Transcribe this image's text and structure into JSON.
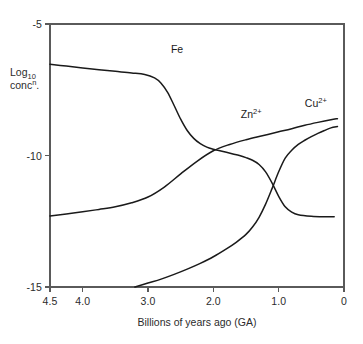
{
  "chart_data": {
    "type": "line",
    "title": "",
    "xlabel": "Billions of years ago (GA)",
    "ylabel_line1": "Log",
    "ylabel_sub": "10",
    "ylabel_line2": "conc",
    "ylabel_sup": "n",
    "ylabel_tail": ".",
    "xlim": [
      4.5,
      0
    ],
    "ylim": [
      -15,
      -5
    ],
    "x_reversed": true,
    "grid": false,
    "legend": "inline curve labels",
    "xticks": [
      {
        "value": 4.5,
        "label": "4.5"
      },
      {
        "value": 4.0,
        "label": "4.0"
      },
      {
        "value": 3.0,
        "label": "3.0"
      },
      {
        "value": 2.0,
        "label": "2.0"
      },
      {
        "value": 1.0,
        "label": "1.0"
      },
      {
        "value": 0.0,
        "label": "0"
      }
    ],
    "yticks": [
      {
        "value": -5,
        "label": "-5"
      },
      {
        "value": -10,
        "label": "-10"
      },
      {
        "value": -15,
        "label": "-15"
      }
    ],
    "series": [
      {
        "name": "Fe",
        "label_html": "Fe",
        "label_x": 2.65,
        "label_y": -6.0,
        "color": "#1a1a1a",
        "x": [
          4.5,
          4.25,
          4.0,
          3.75,
          3.5,
          3.25,
          3.05,
          2.9,
          2.8,
          2.7,
          2.6,
          2.5,
          2.4,
          2.3,
          2.2,
          2.1,
          2.0,
          1.9,
          1.8,
          1.7,
          1.6,
          1.5,
          1.4,
          1.3,
          1.2,
          1.1,
          1.0,
          0.9,
          0.8,
          0.7,
          0.5,
          0.3,
          0.15
        ],
        "y": [
          -6.53,
          -6.6,
          -6.67,
          -6.74,
          -6.8,
          -6.86,
          -6.92,
          -7.05,
          -7.25,
          -7.6,
          -8.1,
          -8.62,
          -9.05,
          -9.35,
          -9.55,
          -9.68,
          -9.76,
          -9.82,
          -9.88,
          -9.94,
          -10.0,
          -10.08,
          -10.18,
          -10.34,
          -10.62,
          -11.05,
          -11.55,
          -11.95,
          -12.15,
          -12.25,
          -12.31,
          -12.33,
          -12.33
        ]
      },
      {
        "name": "Zn2+",
        "label_html": "Zn<sup>2+</sup>",
        "label_x": 1.58,
        "label_y": -8.45,
        "color": "#1a1a1a",
        "x": [
          4.5,
          4.25,
          4.0,
          3.75,
          3.5,
          3.25,
          3.0,
          2.75,
          2.5,
          2.25,
          2.0,
          1.75,
          1.5,
          1.25,
          1.0,
          0.8,
          0.6,
          0.4,
          0.2,
          0.1
        ],
        "y": [
          -12.3,
          -12.22,
          -12.14,
          -12.05,
          -11.95,
          -11.8,
          -11.58,
          -11.2,
          -10.7,
          -10.22,
          -9.82,
          -9.58,
          -9.4,
          -9.25,
          -9.1,
          -8.98,
          -8.85,
          -8.74,
          -8.64,
          -8.6
        ]
      },
      {
        "name": "Cu2+",
        "label_html": "Cu<sup>2+</sup>",
        "label_x": 0.6,
        "label_y": -8.05,
        "color": "#1a1a1a",
        "x": [
          3.2,
          3.0,
          2.8,
          2.6,
          2.4,
          2.2,
          2.0,
          1.8,
          1.65,
          1.5,
          1.4,
          1.3,
          1.2,
          1.1,
          1.0,
          0.9,
          0.8,
          0.7,
          0.6,
          0.5,
          0.4,
          0.3,
          0.2,
          0.1
        ],
        "y": [
          -15.0,
          -14.85,
          -14.7,
          -14.52,
          -14.32,
          -14.1,
          -13.85,
          -13.55,
          -13.3,
          -13.0,
          -12.72,
          -12.35,
          -11.85,
          -11.25,
          -10.62,
          -10.1,
          -9.8,
          -9.58,
          -9.42,
          -9.28,
          -9.16,
          -9.05,
          -8.95,
          -8.9
        ]
      }
    ]
  }
}
